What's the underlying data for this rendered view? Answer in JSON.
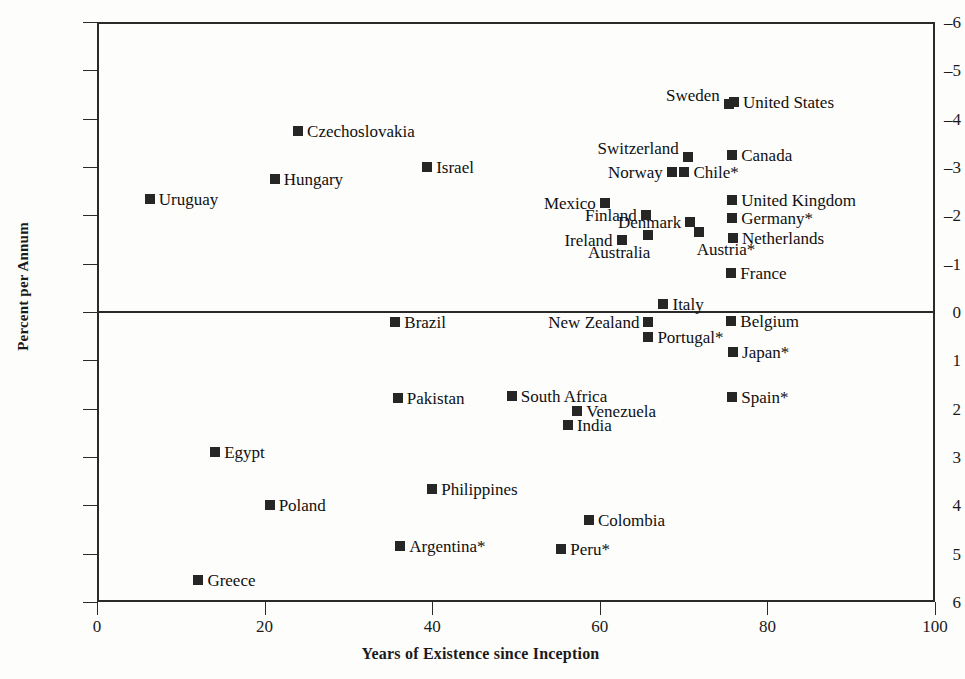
{
  "axis": {
    "ylabel": "Percent per Annum",
    "xlabel": "Years of Existence since Inception",
    "yticks": [
      "6",
      "5",
      "4",
      "3",
      "2",
      "1",
      "0",
      "–1",
      "–2",
      "–3",
      "–4",
      "–5",
      "–6"
    ],
    "xticks": [
      "0",
      "20",
      "40",
      "60",
      "80",
      "100"
    ]
  },
  "chart_data": {
    "type": "scatter",
    "title": "",
    "xlabel": "Years of Existence since Inception",
    "ylabel": "Percent per Annum",
    "xlim": [
      0,
      100
    ],
    "ylim": [
      -6,
      6
    ],
    "xticks": [
      0,
      20,
      40,
      60,
      80,
      100
    ],
    "yticks": [
      -6,
      -5,
      -4,
      -3,
      -2,
      -1,
      0,
      1,
      2,
      3,
      4,
      5,
      6
    ],
    "grid": false,
    "legend": null,
    "note": "Asterisk (*) appended to a country name is part of the plotted label.",
    "points": [
      {
        "label": "United States",
        "x": 76.0,
        "y": 4.35,
        "lx": 743,
        "ly": 100,
        "pos": "r"
      },
      {
        "label": "Sweden",
        "x": 75.4,
        "y": 4.3,
        "lx": 722,
        "ly": 103,
        "pos": "tl"
      },
      {
        "label": "Czechoslovakia",
        "x": 24.0,
        "y": 3.75,
        "lx": 307,
        "ly": 132,
        "pos": "r"
      },
      {
        "label": "Switzerland",
        "x": 70.5,
        "y": 3.2,
        "lx": 697,
        "ly": 158,
        "pos": "tl"
      },
      {
        "label": "Canada",
        "x": 75.8,
        "y": 3.25,
        "lx": 740,
        "ly": 158,
        "pos": "r"
      },
      {
        "label": "Israel",
        "x": 39.4,
        "y": 3.0,
        "lx": 436,
        "ly": 167,
        "pos": "r"
      },
      {
        "label": "Chile*",
        "x": 70.1,
        "y": 2.9,
        "lx": 693,
        "ly": 172,
        "pos": "r"
      },
      {
        "label": "Norway",
        "x": 68.6,
        "y": 2.9,
        "lx": 663,
        "ly": 172,
        "pos": "l"
      },
      {
        "label": "Hungary",
        "x": 21.2,
        "y": 2.75,
        "lx": 284,
        "ly": 179,
        "pos": "r"
      },
      {
        "label": "Uruguay",
        "x": 6.3,
        "y": 2.34,
        "lx": 159,
        "ly": 199,
        "pos": "r"
      },
      {
        "label": "Mexico",
        "x": 60.6,
        "y": 2.26,
        "lx": 596,
        "ly": 203,
        "pos": "l"
      },
      {
        "label": "United Kingdom",
        "x": 75.8,
        "y": 2.32,
        "lx": 741,
        "ly": 200,
        "pos": "r"
      },
      {
        "label": "Finland",
        "x": 65.5,
        "y": 2.01,
        "lx": 637,
        "ly": 215,
        "pos": "l"
      },
      {
        "label": "Germany*",
        "x": 75.8,
        "y": 1.95,
        "lx": 741,
        "ly": 218,
        "pos": "r"
      },
      {
        "label": "Denmark",
        "x": 70.8,
        "y": 1.86,
        "lx": 681,
        "ly": 222,
        "pos": "l"
      },
      {
        "label": "Austria*",
        "x": 71.8,
        "y": 1.66,
        "lx": 708,
        "ly": 232,
        "pos": "br"
      },
      {
        "label": "Australia",
        "x": 65.8,
        "y": 1.59,
        "lx": 657,
        "ly": 235,
        "pos": "bl"
      },
      {
        "label": "Netherlands",
        "x": 75.9,
        "y": 1.53,
        "lx": 742,
        "ly": 238,
        "pos": "r"
      },
      {
        "label": "Ireland",
        "x": 62.6,
        "y": 1.49,
        "lx": 613,
        "ly": 240,
        "pos": "l"
      },
      {
        "label": "France",
        "x": 75.7,
        "y": 0.81,
        "lx": 740,
        "ly": 271,
        "pos": "r"
      },
      {
        "label": "Italy",
        "x": 67.6,
        "y": 0.17,
        "lx": 675,
        "ly": 304,
        "pos": "r"
      },
      {
        "label": "Brazil",
        "x": 35.6,
        "y": -0.21,
        "lx": 404,
        "ly": 322,
        "pos": "r"
      },
      {
        "label": "Belgium",
        "x": 75.7,
        "y": -0.19,
        "lx": 740,
        "ly": 321,
        "pos": "r"
      },
      {
        "label": "New Zealand",
        "x": 65.8,
        "y": -0.21,
        "lx": 639,
        "ly": 322,
        "pos": "l"
      },
      {
        "label": "Portugal*",
        "x": 65.8,
        "y": -0.52,
        "lx": 657,
        "ly": 337,
        "pos": "r"
      },
      {
        "label": "Japan*",
        "x": 75.9,
        "y": -0.83,
        "lx": 742,
        "ly": 352,
        "pos": "r"
      },
      {
        "label": "South Africa",
        "x": 49.5,
        "y": -1.73,
        "lx": 524,
        "ly": 396,
        "pos": "r"
      },
      {
        "label": "Pakistan",
        "x": 35.9,
        "y": -1.78,
        "lx": 407,
        "ly": 398,
        "pos": "r"
      },
      {
        "label": "Spain*",
        "x": 75.8,
        "y": -1.76,
        "lx": 740,
        "ly": 397,
        "pos": "r"
      },
      {
        "label": "Venezuela",
        "x": 57.3,
        "y": -2.05,
        "lx": 588,
        "ly": 411,
        "pos": "r"
      },
      {
        "label": "India",
        "x": 56.2,
        "y": -2.34,
        "lx": 580,
        "ly": 425,
        "pos": "r"
      },
      {
        "label": "Egypt",
        "x": 14.1,
        "y": -2.9,
        "lx": 224,
        "ly": 454,
        "pos": "r"
      },
      {
        "label": "Philippines",
        "x": 40.0,
        "y": -3.67,
        "lx": 441,
        "ly": 489,
        "pos": "r"
      },
      {
        "label": "Poland",
        "x": 20.6,
        "y": -4.0,
        "lx": 278,
        "ly": 505,
        "pos": "r"
      },
      {
        "label": "Colombia",
        "x": 58.7,
        "y": -4.3,
        "lx": 597,
        "ly": 520,
        "pos": "r"
      },
      {
        "label": "Argentina*",
        "x": 36.2,
        "y": -4.85,
        "lx": 410,
        "ly": 547,
        "pos": "r"
      },
      {
        "label": "Peru*",
        "x": 55.4,
        "y": -4.9,
        "lx": 570,
        "ly": 549,
        "pos": "r"
      },
      {
        "label": "Greece",
        "x": 12.1,
        "y": -5.55,
        "lx": 207,
        "ly": 578,
        "pos": "r"
      }
    ]
  }
}
